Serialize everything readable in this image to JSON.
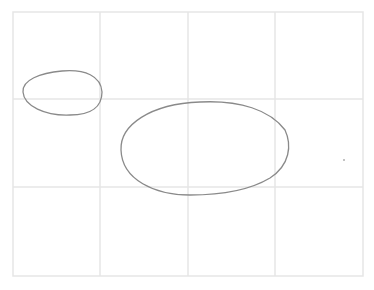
{
  "drawing": {
    "width": 374,
    "height": 290,
    "background": "#ffffff",
    "grid": {
      "color": "#e6e6e6",
      "frame": {
        "x1": 13,
        "y1": 12,
        "x2": 363,
        "y2": 276
      },
      "vertical_lines": [
        100,
        188,
        275
      ],
      "horizontal_lines": [
        99,
        187
      ]
    },
    "stroke_color": "#8a8a8a",
    "shapes": [
      {
        "name": "small-oval",
        "path": "M 23 92 C 22 80, 40 73, 62 71 C 85 69, 101 76, 102 92 C 102 106, 92 115, 70 115 C 45 116, 24 106, 23 92 Z"
      },
      {
        "name": "large-oval",
        "path": "M 121 150 C 120 125, 150 104, 200 102 C 240 100, 270 110, 285 130 C 292 145, 290 165, 270 178 C 250 190, 220 195, 190 195 C 155 195, 122 180, 121 150 Z"
      }
    ],
    "dots": [
      {
        "name": "stray-dot",
        "cx": 344,
        "cy": 160,
        "r": 0.8
      }
    ]
  }
}
